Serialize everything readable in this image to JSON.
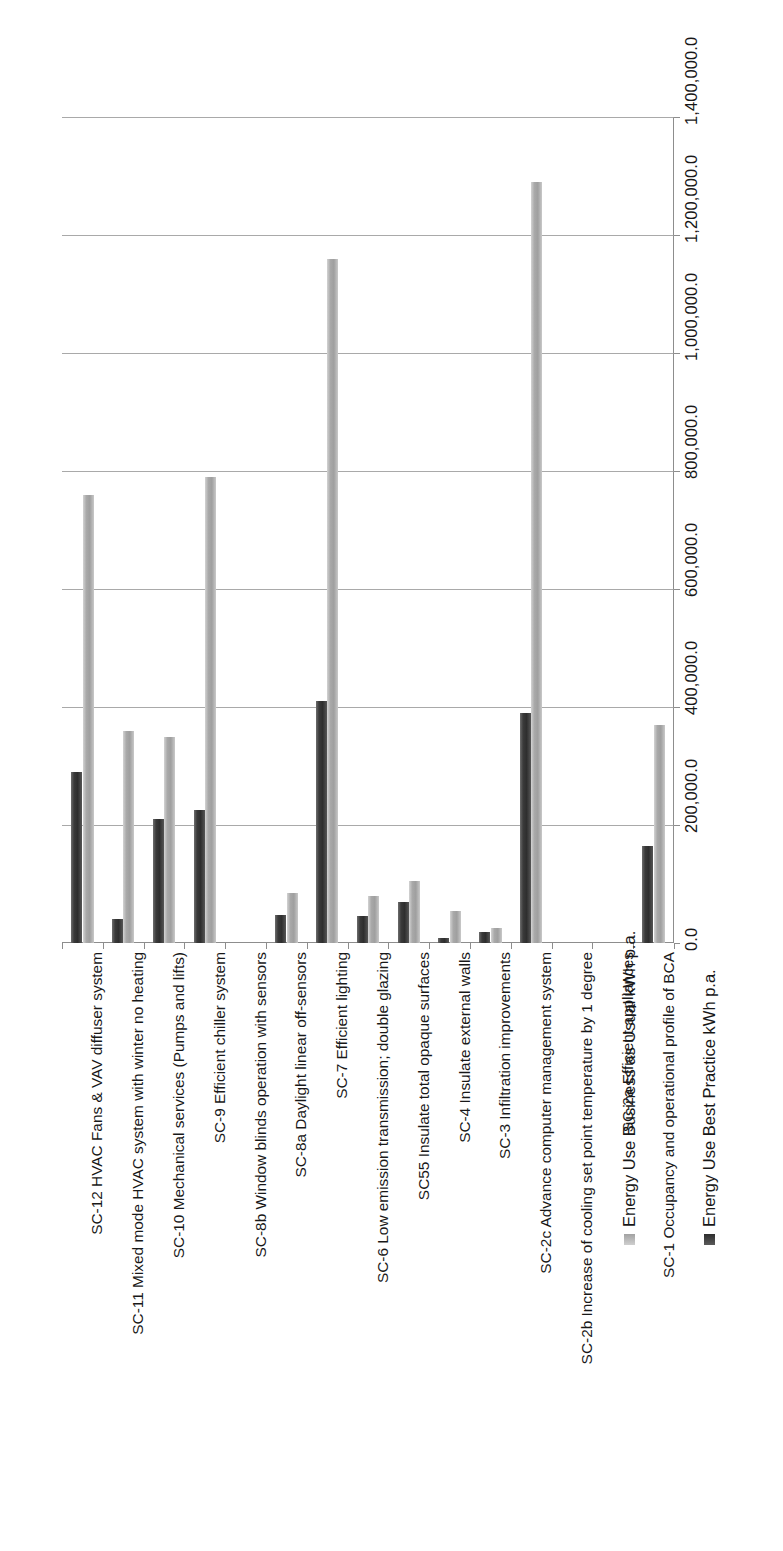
{
  "chart_data": {
    "type": "bar",
    "title": "",
    "subtitle": "",
    "orientation": "rotated-90",
    "xlabel": "",
    "ylabel": "",
    "grid": true,
    "legend_position": "bottom-right-rotated",
    "ylim": [
      0.0,
      1400000.0
    ],
    "ytick_labels": [
      "0.0",
      "200,000.0",
      "400,000.0",
      "600,000.0",
      "800,000.0",
      "1,000,000.0",
      "1,200,000.0",
      "1,400,000.0"
    ],
    "ytick_values": [
      0,
      200000,
      400000,
      600000,
      800000,
      1000000,
      1200000,
      1400000
    ],
    "categories": [
      "SC-12 HVAC Fans & VAV diffuser system",
      "SC-11  Mixed mode HVAC system with winter no heating",
      "SC-10 Mechanical services (Pumps and lifts)",
      "SC-9 Efficient chiller system",
      "SC-8b Window blinds operation with sensors",
      "SC-8a Daylight linear off-sensors",
      "SC-7 Efficient lighting",
      "SC-6 Low emission transmission; double glazing",
      "SC55 Insulate total opaque surfaces",
      "SC-4 Insulate external walls",
      "SC-3 Infiltration improvements",
      "SC-2c Advance computer management system",
      "SC-2b Increase of cooling set point temperature by 1 degree",
      "SC-2a Efficient appliances",
      "SC-1 Occupancy and operational profile of BCA"
    ],
    "series": [
      {
        "name": "Energy Use Best Practice kWh p.a.",
        "color": "#2e2e2e",
        "values": [
          290000,
          40000,
          210000,
          225000,
          0,
          48000,
          410000,
          45000,
          70000,
          8000,
          18000,
          390000,
          0,
          0,
          165000
        ]
      },
      {
        "name": "Energy Use Business as Usual kWh p.a.",
        "color": "#a9a9a9",
        "values": [
          760000,
          360000,
          350000,
          790000,
          0,
          85000,
          1160000,
          80000,
          105000,
          55000,
          25000,
          1290000,
          0,
          0,
          370000
        ]
      }
    ]
  },
  "legend": {
    "entries": [
      {
        "label": "Energy Use Best Practice kWh p.a.",
        "swatch": "best"
      },
      {
        "label": "Energy Use Business as Usual kWh p.a.",
        "swatch": "bau"
      }
    ]
  },
  "colors": {
    "best_practice": "#2e2e2e",
    "business_as_usual": "#a9a9a9",
    "gridline": "#9a9a9a",
    "axis": "#8d8d8d",
    "text": "#181818",
    "background": "#ffffff"
  }
}
